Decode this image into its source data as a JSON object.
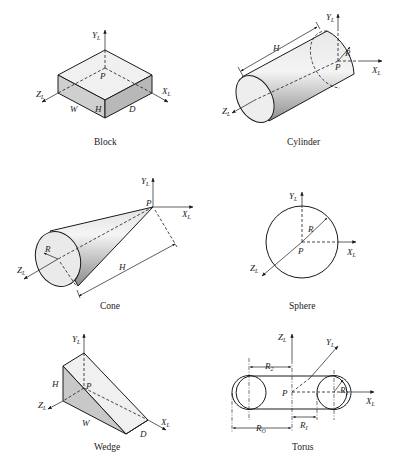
{
  "figures": [
    {
      "id": "block",
      "caption": "Block",
      "labels": {
        "y_axis": "Y",
        "y_sub": "L",
        "x_axis": "X",
        "x_sub": "L",
        "z_axis": "Z",
        "z_sub": "L",
        "origin": "P",
        "width": "W",
        "height": "H",
        "depth": "D"
      }
    },
    {
      "id": "cylinder",
      "caption": "Cylinder",
      "labels": {
        "y_axis": "Y",
        "y_sub": "L",
        "x_axis": "X",
        "x_sub": "L",
        "z_axis": "Z",
        "z_sub": "L",
        "origin": "P",
        "height": "H",
        "radius": "R"
      }
    },
    {
      "id": "cone",
      "caption": "Cone",
      "labels": {
        "y_axis": "Y",
        "y_sub": "L",
        "x_axis": "X",
        "x_sub": "L",
        "z_axis": "Z",
        "z_sub": "L",
        "origin": "P",
        "height": "H",
        "radius": "R"
      }
    },
    {
      "id": "sphere",
      "caption": "Sphere",
      "labels": {
        "y_axis": "Y",
        "y_sub": "L",
        "x_axis": "X",
        "x_sub": "L",
        "z_axis": "Z",
        "z_sub": "L",
        "origin": "P",
        "radius": "R"
      }
    },
    {
      "id": "wedge",
      "caption": "Wedge",
      "labels": {
        "y_axis": "Y",
        "y_sub": "L",
        "x_axis": "X",
        "x_sub": "L",
        "z_axis": "Z",
        "z_sub": "L",
        "origin": "P",
        "width": "W",
        "height": "H",
        "depth": "D"
      }
    },
    {
      "id": "torus",
      "caption": "Torus",
      "labels": {
        "z_axis": "Z",
        "z_sub": "L",
        "y_axis": "Y",
        "y_sub": "L",
        "x_axis": "X",
        "x_sub": "L",
        "origin": "P",
        "r1": "R",
        "r1_sub": "1",
        "r2": "R",
        "r2_sub": "2",
        "ri": "R",
        "ri_sub": "I",
        "ro": "R",
        "ro_sub": "O"
      }
    }
  ]
}
